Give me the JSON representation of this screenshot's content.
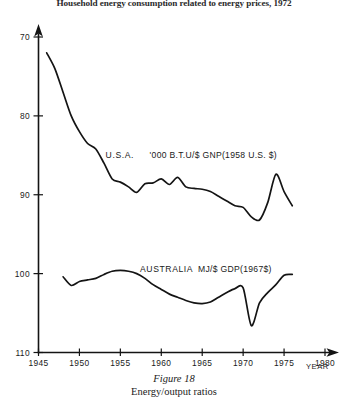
{
  "figure": {
    "title": "Household energy consumption related to energy prices, 1972",
    "caption_label": "Figure 18",
    "caption_text": "Energy/output ratios"
  },
  "chart_data": {
    "type": "line",
    "title": "Household energy consumption related to energy prices, 1972",
    "xlabel": "YEAR",
    "ylabel": "",
    "xlim": [
      1945,
      1980
    ],
    "ylim": [
      70,
      110
    ],
    "grid": false,
    "legend": "inline-annotation",
    "xticks": [
      1945,
      1950,
      1955,
      1960,
      1965,
      1970,
      1975,
      1980
    ],
    "yticks": [
      70,
      80,
      90,
      100,
      110
    ],
    "annotations": [
      {
        "name": "U.S.A.",
        "units": "'000 B.T.U/$ GNP(1958 U.S. $)",
        "x": 1953.2,
        "y": 94.6
      },
      {
        "name": "AUSTRALIA",
        "units": "MJ/$ GDP(1967$)",
        "x": 1957.4,
        "y": 80.2
      }
    ],
    "series": [
      {
        "name": "U.S.A.",
        "units": "'000 B.T.U/$ GNP(1958 U.S. $)",
        "x": [
          1946,
          1947,
          1948,
          1949,
          1950,
          1951,
          1952,
          1953,
          1954,
          1955,
          1956,
          1957,
          1958,
          1959,
          1960,
          1961,
          1962,
          1963,
          1964,
          1965,
          1966,
          1967,
          1968,
          1969,
          1970,
          1971,
          1972,
          1973,
          1974,
          1975,
          1976
        ],
        "y": [
          108.0,
          106.0,
          103.0,
          100.0,
          98.0,
          96.5,
          95.8,
          94.0,
          92.0,
          91.6,
          91.0,
          90.3,
          91.4,
          91.5,
          92.0,
          91.3,
          92.2,
          91.0,
          90.8,
          90.7,
          90.4,
          89.8,
          89.2,
          88.6,
          88.4,
          87.2,
          86.8,
          89.0,
          92.6,
          90.4,
          88.6
        ]
      },
      {
        "name": "AUSTRALIA",
        "units": "MJ/$ GDP(1967$)",
        "x": [
          1948,
          1949,
          1950,
          1951,
          1952,
          1953,
          1954,
          1955,
          1956,
          1957,
          1958,
          1959,
          1960,
          1961,
          1962,
          1963,
          1964,
          1965,
          1966,
          1967,
          1968,
          1969,
          1970,
          1971,
          1972,
          1973,
          1974,
          1975,
          1976
        ],
        "y": [
          79.6,
          78.5,
          79.0,
          79.2,
          79.4,
          79.9,
          80.3,
          80.4,
          80.3,
          80.0,
          79.4,
          78.6,
          78.0,
          77.4,
          77.0,
          76.6,
          76.3,
          76.2,
          76.4,
          77.0,
          77.6,
          78.1,
          78.2,
          73.4,
          76.3,
          77.6,
          78.6,
          79.8,
          79.9
        ]
      }
    ]
  },
  "axes": {
    "y_tick_labels": [
      "110",
      "100",
      "90",
      "80",
      "70"
    ],
    "x_tick_labels": [
      "1945",
      "1950",
      "1955",
      "1960",
      "1965",
      "1970",
      "1975",
      "1980"
    ],
    "x_axis_name": "YEAR"
  }
}
